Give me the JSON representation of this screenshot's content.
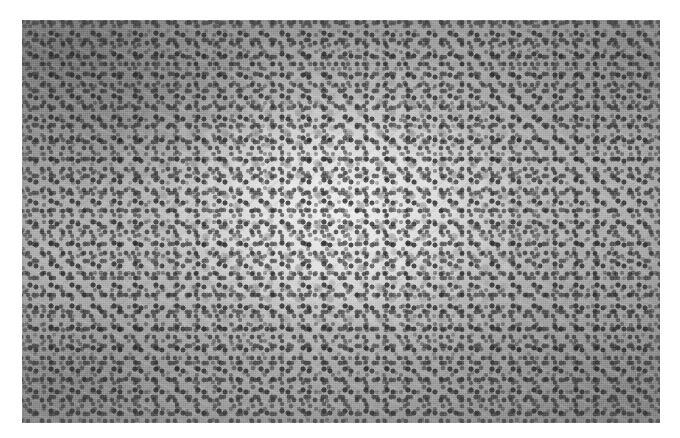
{
  "figure": {
    "kind": "histopathology-micrograph",
    "stain": "hematoxylin and eosin",
    "rendering": "grayscale",
    "caption": "",
    "background_color": "#ffffff",
    "image_area": {
      "left_px": 22,
      "top_px": 20,
      "width_px": 638,
      "height_px": 403
    },
    "tones": {
      "lightest": "#ececec",
      "mid": "#a8a8a8",
      "darkest": "#2c2c2c",
      "nucleus_dark": "#303030",
      "cytoplasm_pale": "#e4e4e4"
    },
    "regions": [
      {
        "name": "germinal-center",
        "description": "pale central follicle with larger vesicular nuclei and abundant pale cytoplasm",
        "position": "center",
        "relative_tone": "light"
      },
      {
        "name": "mantle-zone-upper-left",
        "description": "dark cuff of small dense lymphocyte nuclei",
        "position": "upper-left",
        "relative_tone": "dark"
      },
      {
        "name": "mantle-zone-upper-right",
        "description": "dense small dark nuclei",
        "position": "upper-right",
        "relative_tone": "dark"
      },
      {
        "name": "mantle-zone-lower-left",
        "description": "dense small dark nuclei with fibrous streaks",
        "position": "lower-left",
        "relative_tone": "dark"
      },
      {
        "name": "mantle-zone-lower-right",
        "description": "dense small dark nuclei",
        "position": "lower-right",
        "relative_tone": "dark"
      }
    ]
  }
}
